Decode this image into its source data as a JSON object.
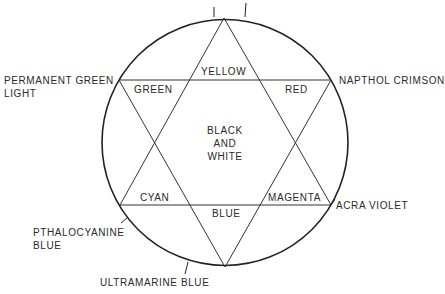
{
  "diagram": {
    "type": "color-wheel-hexagram",
    "stroke_color": "#222222",
    "background": "#ffffff",
    "center_label": [
      "BLACK",
      "AND",
      "WHITE"
    ],
    "inner_labels": {
      "top": "YELLOW",
      "upper_left": "GREEN",
      "upper_right": "RED",
      "lower_left": "CYAN",
      "bottom": "BLUE",
      "lower_right": "MAGENTA"
    },
    "outer_labels": {
      "upper_left": [
        "PERMANENT GREEN",
        "LIGHT"
      ],
      "upper_right": "NAPTHOL CRIMSON",
      "lower_right": "ACRA VIOLET",
      "lower_left": [
        "PTHALOCYANINE",
        "BLUE"
      ],
      "bottom": "ULTRAMARINE BLUE"
    }
  }
}
